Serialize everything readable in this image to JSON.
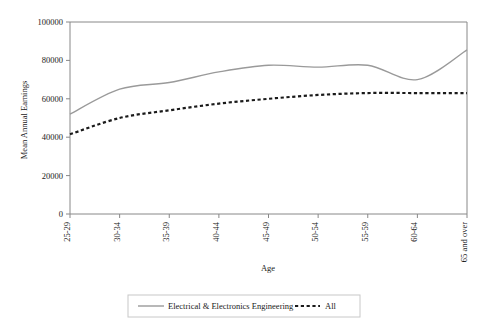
{
  "chart_data": {
    "type": "line",
    "title": "",
    "xlabel": "Age",
    "ylabel": "Mean Annual Earnings",
    "categories": [
      "25-29",
      "30-34",
      "35-39",
      "40-44",
      "45-49",
      "50-54",
      "55-59",
      "60-64",
      "65 and over"
    ],
    "ylim": [
      0,
      100000
    ],
    "yticks": [
      0,
      20000,
      40000,
      60000,
      80000,
      100000
    ],
    "ytick_labels": [
      "0",
      "20000",
      "40000",
      "60000",
      "80000",
      "100000"
    ],
    "grid": false,
    "legend_position": "bottom",
    "series": [
      {
        "name": "Electrical & Electronics Engineering",
        "style": "solid",
        "color": "#9a9a9a",
        "values": [
          52000,
          65000,
          68500,
          74000,
          77500,
          76500,
          77500,
          70000,
          85500
        ]
      },
      {
        "name": "All",
        "style": "dotted",
        "color": "#1a1a1a",
        "values": [
          41500,
          50000,
          54000,
          57500,
          60000,
          62000,
          63000,
          63000,
          63000
        ]
      }
    ]
  },
  "legend": {
    "items": [
      {
        "label": "Electrical & Electronics Engineering",
        "style": "solid"
      },
      {
        "label": "All",
        "style": "dotted"
      }
    ]
  },
  "axes": {
    "y_title": "Mean Annual Earnings",
    "x_title": "Age"
  }
}
